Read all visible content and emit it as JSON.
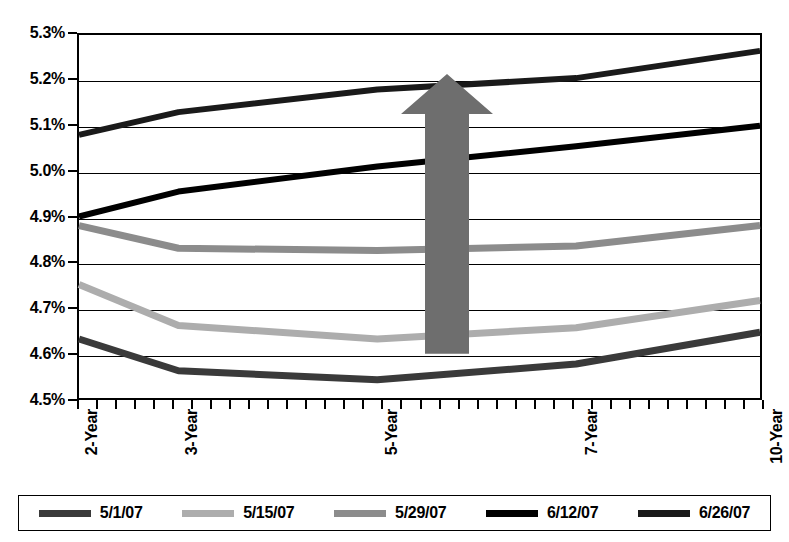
{
  "chart_data": {
    "type": "line",
    "title": "",
    "subtitle": "",
    "xlabel": "",
    "ylabel": "",
    "grid": true,
    "legend_position": "bottom",
    "categories": [
      "2-Year",
      "3-Year",
      "5-Year",
      "7-Year",
      "10-Year"
    ],
    "x_positions_pct": [
      0,
      14.6,
      43.8,
      73.0,
      100
    ],
    "ylim": [
      4.5,
      5.3
    ],
    "ytick_labels": [
      "5.3%",
      "5.2%",
      "5.1%",
      "5.0%",
      "4.9%",
      "4.8%",
      "4.7%",
      "4.6%",
      "4.5%"
    ],
    "ytick_values": [
      5.3,
      5.2,
      5.1,
      5.0,
      4.9,
      4.8,
      4.7,
      4.6,
      4.5
    ],
    "x_minor_tick_count": 36,
    "series": [
      {
        "name": "5/1/07",
        "color": "#3a3a3a",
        "width": 7,
        "values": [
          4.63,
          4.56,
          4.54,
          4.575,
          4.645
        ]
      },
      {
        "name": "5/15/07",
        "color": "#adadad",
        "width": 7,
        "values": [
          4.75,
          4.66,
          4.63,
          4.655,
          4.715
        ]
      },
      {
        "name": "5/29/07",
        "color": "#8c8c8c",
        "width": 7,
        "values": [
          4.88,
          4.83,
          4.825,
          4.835,
          4.88
        ]
      },
      {
        "name": "6/12/07",
        "color": "#000000",
        "width": 6,
        "values": [
          4.9,
          4.955,
          5.01,
          5.055,
          5.1
        ]
      },
      {
        "name": "6/26/07",
        "color": "#1a1a1a",
        "width": 6,
        "values": [
          5.08,
          5.13,
          5.18,
          5.205,
          5.265
        ]
      }
    ],
    "annotations": [
      {
        "kind": "arrow",
        "direction": "up",
        "color": "#6e6e6e",
        "x_pct": 54.0,
        "y_tail": 4.6,
        "y_head": 5.21
      }
    ]
  },
  "legend": {
    "items": [
      {
        "label": "5/1/07",
        "color": "#3a3a3a"
      },
      {
        "label": "5/15/07",
        "color": "#adadad"
      },
      {
        "label": "5/29/07",
        "color": "#8c8c8c"
      },
      {
        "label": "6/12/07",
        "color": "#000000"
      },
      {
        "label": "6/26/07",
        "color": "#1a1a1a"
      }
    ]
  }
}
